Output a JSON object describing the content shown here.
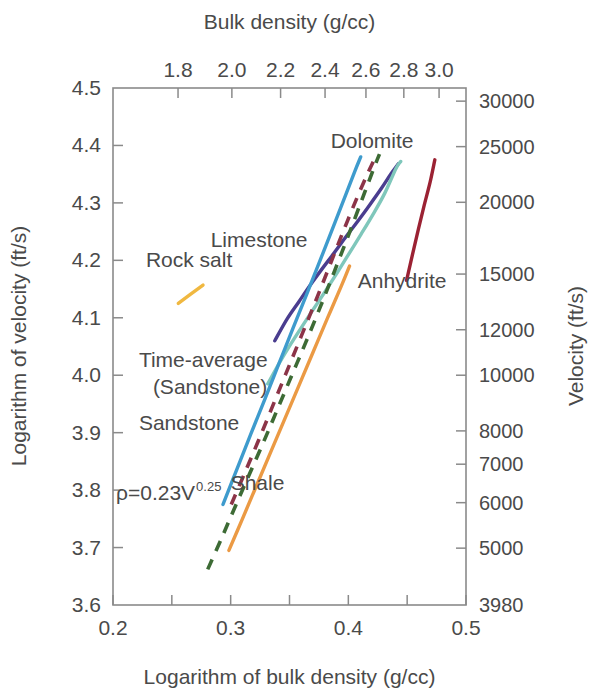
{
  "figure": {
    "background": "#ffffff",
    "axis_color": "#8a8a8a",
    "text_color": "#4a4a4a"
  },
  "axes": {
    "bottom": {
      "title": "Logarithm of bulk density (g/cc)",
      "ticks": [
        "0.2",
        "0.3",
        "0.4",
        "0.5"
      ],
      "range": [
        0.2,
        0.5
      ]
    },
    "top": {
      "title": "Bulk density (g/cc)",
      "ticks": [
        "1.8",
        "2.0",
        "2.2",
        "2.4",
        "2.6",
        "2.8",
        "3.0"
      ],
      "tick_values": [
        1.8,
        2.0,
        2.2,
        2.4,
        2.6,
        2.8,
        3.0
      ]
    },
    "left": {
      "title": "Logarithm of velocity (ft/s)",
      "ticks": [
        "4.5",
        "4.4",
        "4.3",
        "4.2",
        "4.1",
        "4.0",
        "3.9",
        "3.8",
        "3.7",
        "3.6"
      ],
      "range": [
        3.6,
        4.5
      ]
    },
    "right": {
      "title": "Velocity (ft/s)",
      "ticks": [
        "30000",
        "25000",
        "20000",
        "15000",
        "12000",
        "10000",
        "8000",
        "7000",
        "6000",
        "5000",
        "3980"
      ],
      "tick_values": [
        30000,
        25000,
        20000,
        15000,
        12000,
        10000,
        8000,
        7000,
        6000,
        5000,
        3980
      ]
    }
  },
  "annotations": {
    "equation_base": "ρ=0.23V",
    "equation_exponent": "0.25"
  },
  "chart_data": {
    "type": "line",
    "title": "",
    "xlabel": "Logarithm of bulk density (g/cc)",
    "ylabel": "Logarithm of velocity (ft/s)",
    "xlim": [
      0.2,
      0.5
    ],
    "ylim": [
      3.6,
      4.5
    ],
    "grid": false,
    "legend": "inline-labels",
    "secondary_xlabel": "Bulk density (g/cc)",
    "secondary_ylabel": "Velocity (ft/s)",
    "series": [
      {
        "name": "Dolomite",
        "label": "Dolomite",
        "color": "#4a3d8f",
        "style": "solid",
        "label_x": 0.385,
        "label_y": 4.395,
        "points": [
          [
            0.3375,
            4.06
          ],
          [
            0.348,
            4.098
          ],
          [
            0.358,
            4.128
          ],
          [
            0.368,
            4.158
          ],
          [
            0.378,
            4.186
          ],
          [
            0.388,
            4.213
          ],
          [
            0.398,
            4.241
          ],
          [
            0.408,
            4.268
          ],
          [
            0.418,
            4.296
          ],
          [
            0.428,
            4.325
          ],
          [
            0.436,
            4.35
          ],
          [
            0.4425,
            4.368
          ]
        ]
      },
      {
        "name": "Limestone",
        "label": "Limestone",
        "color": "#7fc7bb",
        "style": "solid",
        "label_x": 0.283,
        "label_y": 4.223,
        "points": [
          [
            0.3315,
            3.985
          ],
          [
            0.341,
            4.02
          ],
          [
            0.351,
            4.054
          ],
          [
            0.361,
            4.086
          ],
          [
            0.371,
            4.117
          ],
          [
            0.381,
            4.148
          ],
          [
            0.391,
            4.18
          ],
          [
            0.401,
            4.213
          ],
          [
            0.411,
            4.246
          ],
          [
            0.421,
            4.28
          ],
          [
            0.431,
            4.317
          ],
          [
            0.4405,
            4.36
          ],
          [
            0.4445,
            4.372
          ]
        ]
      },
      {
        "name": "Anhydrite",
        "label": "Anhydrite",
        "color": "#9b2233",
        "style": "solid",
        "label_x": 0.408,
        "label_y": 4.152,
        "points": [
          [
            0.4495,
            4.165
          ],
          [
            0.4545,
            4.21
          ],
          [
            0.4595,
            4.254
          ],
          [
            0.4645,
            4.296
          ],
          [
            0.4695,
            4.336
          ],
          [
            0.4735,
            4.375
          ]
        ]
      },
      {
        "name": "Rock salt",
        "label": "Rock salt",
        "color": "#f0b840",
        "style": "solid",
        "label_x": 0.228,
        "label_y": 4.188,
        "points": [
          [
            0.2555,
            4.125
          ],
          [
            0.2765,
            4.157
          ]
        ]
      },
      {
        "name": "Time-average (Sandstone)",
        "label": "Time-average",
        "label2": "(Sandstone)",
        "color": "#8c3448",
        "style": "dashed",
        "label_x": 0.222,
        "label_y": 4.015,
        "points": [
          [
            0.3005,
            3.775
          ],
          [
            0.312,
            3.83
          ],
          [
            0.324,
            3.888
          ],
          [
            0.336,
            3.948
          ],
          [
            0.348,
            4.008
          ],
          [
            0.36,
            4.068
          ],
          [
            0.372,
            4.128
          ],
          [
            0.384,
            4.19
          ],
          [
            0.396,
            4.252
          ],
          [
            0.408,
            4.312
          ],
          [
            0.418,
            4.358
          ],
          [
            0.4235,
            4.382
          ]
        ]
      },
      {
        "name": "Sandstone",
        "label": "Sandstone",
        "color": "#3e9bcd",
        "style": "solid",
        "label_x": 0.222,
        "label_y": 3.905,
        "points": [
          [
            0.2935,
            3.775
          ],
          [
            0.305,
            3.835
          ],
          [
            0.317,
            3.897
          ],
          [
            0.329,
            3.958
          ],
          [
            0.341,
            4.02
          ],
          [
            0.353,
            4.082
          ],
          [
            0.365,
            4.143
          ],
          [
            0.377,
            4.205
          ],
          [
            0.389,
            4.268
          ],
          [
            0.3985,
            4.318
          ],
          [
            0.4055,
            4.355
          ],
          [
            0.4105,
            4.38
          ]
        ]
      },
      {
        "name": "rho = 0.23 V^0.25",
        "label": "ρ=0.23V",
        "color": "#3d6b35",
        "style": "dashed",
        "label_x": 0.204,
        "label_y": 3.8,
        "points": [
          [
            0.2805,
            3.662
          ],
          [
            0.292,
            3.715
          ],
          [
            0.304,
            3.772
          ],
          [
            0.316,
            3.828
          ],
          [
            0.328,
            3.884
          ],
          [
            0.34,
            3.942
          ],
          [
            0.352,
            4.0
          ],
          [
            0.364,
            4.058
          ],
          [
            0.376,
            4.118
          ],
          [
            0.388,
            4.18
          ],
          [
            0.4,
            4.243
          ],
          [
            0.412,
            4.308
          ],
          [
            0.422,
            4.362
          ],
          [
            0.4265,
            4.385
          ]
        ]
      },
      {
        "name": "Shale",
        "label": "Shale",
        "color": "#eb9a44",
        "style": "solid",
        "label_x": 0.3,
        "label_y": 3.8,
        "points": [
          [
            0.2985,
            3.695
          ],
          [
            0.31,
            3.75
          ],
          [
            0.322,
            3.808
          ],
          [
            0.334,
            3.866
          ],
          [
            0.346,
            3.924
          ],
          [
            0.358,
            3.982
          ],
          [
            0.37,
            4.04
          ],
          [
            0.382,
            4.098
          ],
          [
            0.394,
            4.155
          ],
          [
            0.401,
            4.19
          ]
        ]
      }
    ]
  }
}
